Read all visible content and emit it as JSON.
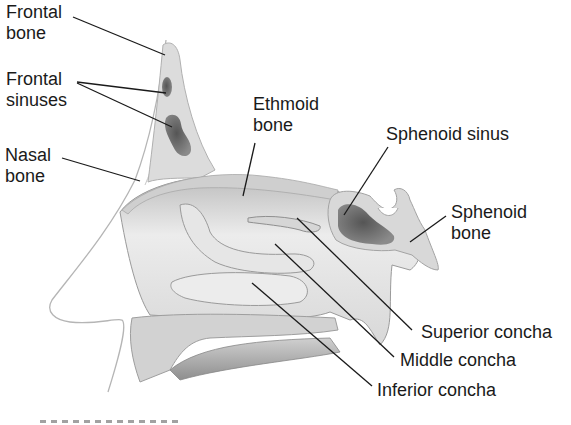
{
  "diagram": {
    "colors": {
      "background": "#ffffff",
      "text": "#1a1a1a",
      "leader_line": "#1a1a1a",
      "bone_light": "#e4e4e4",
      "bone_mid": "#c9c9c9",
      "cavity_dark": "#6e6e6e",
      "outline": "#9a9a9a"
    },
    "labels": [
      {
        "id": "frontal-bone",
        "line1": "Frontal",
        "line2": "bone"
      },
      {
        "id": "frontal-sinuses",
        "line1": "Frontal",
        "line2": "sinuses"
      },
      {
        "id": "nasal-bone",
        "line1": "Nasal",
        "line2": "bone"
      },
      {
        "id": "ethmoid-bone",
        "line1": "Ethmoid",
        "line2": "bone"
      },
      {
        "id": "sphenoid-sinus",
        "line1": "Sphenoid sinus"
      },
      {
        "id": "sphenoid-bone",
        "line1": "Sphenoid",
        "line2": "bone"
      },
      {
        "id": "superior-concha",
        "line1": "Superior concha"
      },
      {
        "id": "middle-concha",
        "line1": "Middle concha"
      },
      {
        "id": "inferior-concha",
        "line1": "Inferior concha"
      }
    ]
  }
}
